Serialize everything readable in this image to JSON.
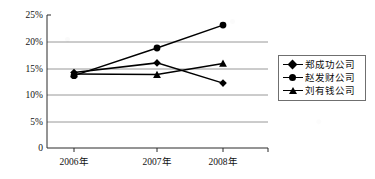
{
  "chart_data": {
    "type": "line",
    "title": "",
    "xlabel": "",
    "ylabel": "",
    "categories": [
      "2006年",
      "2007年",
      "2008年"
    ],
    "ylim": [
      0,
      25
    ],
    "ytick_labels": [
      "25%",
      "20%",
      "15%",
      "10%",
      "5%",
      "0"
    ],
    "ytick_values": [
      25,
      20,
      15,
      10,
      5,
      0
    ],
    "grid": true,
    "legend_position": "right",
    "series": [
      {
        "name": "郑成功公司",
        "marker": "diamond",
        "values": [
          14.2,
          16.0,
          12.2
        ]
      },
      {
        "name": "赵发财公司",
        "marker": "circle",
        "values": [
          13.6,
          18.8,
          23.1
        ]
      },
      {
        "name": "刘有钱公司",
        "marker": "triangle",
        "values": [
          13.9,
          13.8,
          15.9
        ]
      }
    ]
  },
  "axis": {
    "tick_0": "25%",
    "tick_1": "20%",
    "tick_2": "15%",
    "tick_3": "10%",
    "tick_4": "5%",
    "tick_5": "0",
    "cat_0": "2006年",
    "cat_1": "2007年",
    "cat_2": "2008年"
  },
  "legend": {
    "items": [
      {
        "label": "郑成功公司",
        "marker": "diamond"
      },
      {
        "label": "赵发财公司",
        "marker": "circle"
      },
      {
        "label": "刘有钱公司",
        "marker": "triangle"
      }
    ]
  },
  "colors": {
    "series_line": "#000000",
    "gridline": "#8d8d8d",
    "axis": "#2b2b2b",
    "background": "#ffffff"
  }
}
